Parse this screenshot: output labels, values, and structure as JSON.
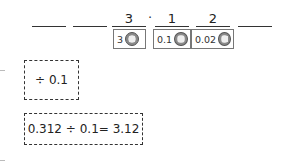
{
  "place_value_chart": {
    "slots": [
      "",
      "",
      "3",
      "1",
      "2",
      ""
    ],
    "decimal_point": "·",
    "tokens": [
      {
        "label": "3",
        "icon": "coin-icon"
      },
      {
        "label": "0.1",
        "icon": "coin-icon"
      },
      {
        "label": "0.02",
        "icon": "coin-icon"
      }
    ]
  },
  "operation_box": {
    "text": "÷ 0.1"
  },
  "equation_box": {
    "text": "0.312 ÷ 0.1= 3.12"
  },
  "colors": {
    "line": "#333333",
    "token_border": "#777777",
    "coin": "#8a8a8a"
  }
}
